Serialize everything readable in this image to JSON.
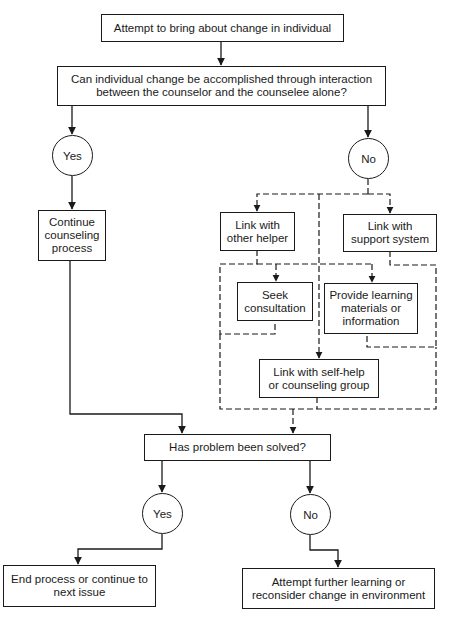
{
  "diagram": {
    "type": "flowchart",
    "nodes": {
      "start": {
        "lines": [
          "Attempt to bring about change in individual"
        ]
      },
      "question1": {
        "lines": [
          "Can individual change be accomplished through interaction",
          "between the counselor and the counselee alone?"
        ]
      },
      "yes1": {
        "label": "Yes"
      },
      "no1": {
        "label": "No"
      },
      "continue": {
        "lines": [
          "Continue",
          "counseling",
          "process"
        ]
      },
      "other_helper": {
        "lines": [
          "Link with",
          "other helper"
        ]
      },
      "support_system": {
        "lines": [
          "Link with",
          "support system"
        ]
      },
      "consultation": {
        "lines": [
          "Seek",
          "consultation"
        ]
      },
      "learning_materials": {
        "lines": [
          "Provide learning",
          "materials or",
          "information"
        ]
      },
      "self_help": {
        "lines": [
          "Link with self-help",
          "or counseling group"
        ]
      },
      "question2": {
        "lines": [
          "Has problem been solved?"
        ]
      },
      "yes2": {
        "label": "Yes"
      },
      "no2": {
        "label": "No"
      },
      "end": {
        "lines": [
          "End process or continue to",
          "next issue"
        ]
      },
      "further": {
        "lines": [
          "Attempt further learning or",
          "reconsider change in environment"
        ]
      }
    },
    "edges": [
      {
        "from": "start",
        "to": "question1",
        "style": "solid"
      },
      {
        "from": "question1",
        "to": "yes1",
        "style": "solid"
      },
      {
        "from": "question1",
        "to": "no1",
        "style": "solid"
      },
      {
        "from": "yes1",
        "to": "continue",
        "style": "solid"
      },
      {
        "from": "no1",
        "to": "other_helper",
        "style": "dashed"
      },
      {
        "from": "no1",
        "to": "support_system",
        "style": "dashed"
      },
      {
        "from": "no1",
        "to": "self_help",
        "style": "dashed"
      },
      {
        "from": "other_helper",
        "to": "consultation",
        "style": "dashed"
      },
      {
        "from": "support_system",
        "to": "learning_materials",
        "style": "dashed"
      },
      {
        "from": "self_help",
        "to": "question2",
        "style": "dashed"
      },
      {
        "from": "continue",
        "to": "question2",
        "style": "solid"
      },
      {
        "from": "question2",
        "to": "yes2",
        "style": "solid"
      },
      {
        "from": "question2",
        "to": "no2",
        "style": "solid"
      },
      {
        "from": "yes2",
        "to": "end",
        "style": "solid"
      },
      {
        "from": "no2",
        "to": "further",
        "style": "solid"
      }
    ],
    "colors": {
      "ink": "#1a1a1a",
      "background": "#ffffff"
    }
  }
}
